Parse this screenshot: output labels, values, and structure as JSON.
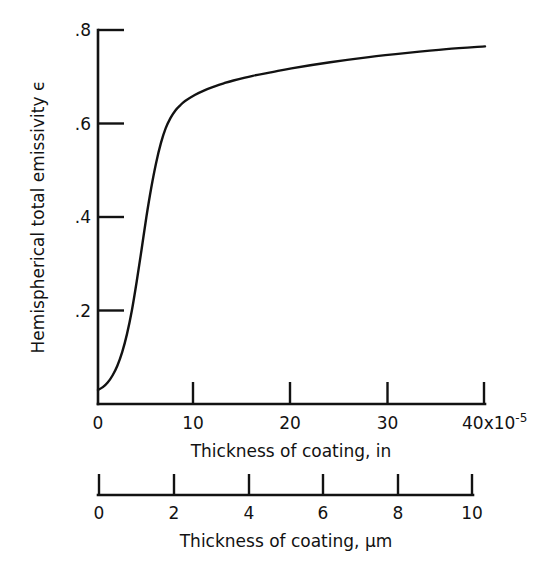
{
  "chart_data": {
    "type": "line",
    "title": "",
    "subtitle": "",
    "ylabel": "Hemispherical total emissivity  ϵ",
    "ylim": [
      0,
      0.8
    ],
    "y_ticks": [
      0,
      0.2,
      0.4,
      0.6,
      0.8
    ],
    "y_tick_labels": [
      "0",
      ".2",
      ".4",
      ".6",
      ".8"
    ],
    "grid": false,
    "legend": null,
    "axes": [
      {
        "id": "primary-x",
        "xlabel": "Thickness of coating, in",
        "xlim": [
          0,
          40
        ],
        "x_ticks": [
          0,
          10,
          20,
          30,
          40
        ],
        "x_tick_labels": [
          "0",
          "10",
          "20",
          "30",
          "40"
        ],
        "exponent_label": "40x10",
        "exponent_superscript": "-5",
        "units": "in"
      },
      {
        "id": "secondary-x",
        "xlabel": "Thickness of coating,  µm",
        "xlim": [
          0,
          10
        ],
        "x_ticks": [
          0,
          2,
          4,
          6,
          8,
          10
        ],
        "x_tick_labels": [
          "0",
          "2",
          "4",
          "6",
          "8",
          "10"
        ],
        "units": "µm"
      }
    ],
    "series": [
      {
        "name": "Hemispherical total emissivity vs coating thickness",
        "color": "#121212",
        "x_units": "in x10^-5",
        "x": [
          0.0,
          0.5,
          1.0,
          1.5,
          2.0,
          2.5,
          3.0,
          3.5,
          4.0,
          4.5,
          5.0,
          5.5,
          6.0,
          6.5,
          7.0,
          7.5,
          8.0,
          8.5,
          9.0,
          10.0,
          11.0,
          12.0,
          13.0,
          14.0,
          16.0,
          18.0,
          20.0,
          24.0,
          28.0,
          32.0,
          36.0,
          40.0
        ],
        "values": [
          0.03,
          0.036,
          0.046,
          0.061,
          0.082,
          0.111,
          0.15,
          0.2,
          0.262,
          0.33,
          0.4,
          0.462,
          0.515,
          0.558,
          0.59,
          0.612,
          0.628,
          0.639,
          0.648,
          0.661,
          0.671,
          0.679,
          0.686,
          0.692,
          0.702,
          0.71,
          0.718,
          0.731,
          0.742,
          0.751,
          0.759,
          0.765
        ]
      }
    ]
  },
  "geometry": {
    "plot_left_px": 98,
    "plot_right_px": 485,
    "plot_top_px": 30,
    "plot_bottom_px": 404,
    "secondary_axis_y_px": 483,
    "secondary_axis_right_px": 473
  }
}
